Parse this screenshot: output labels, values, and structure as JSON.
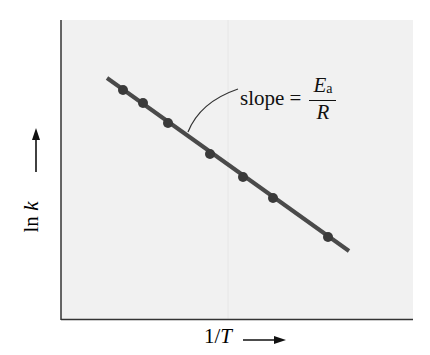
{
  "chart_data": {
    "type": "scatter",
    "title": "",
    "xlabel": "1/T",
    "ylabel": "ln k",
    "x_axis_arrow": "right-arrow",
    "y_axis_arrow": "up-arrow",
    "grid": false,
    "ticks": "none",
    "series": [
      {
        "name": "ln k vs 1/T",
        "points_px": [
          [
            123,
            90
          ],
          [
            143,
            103
          ],
          [
            168,
            123
          ],
          [
            210,
            154
          ],
          [
            243,
            177
          ],
          [
            273,
            198
          ],
          [
            328,
            237
          ]
        ],
        "x": [
          0.18,
          0.23,
          0.3,
          0.42,
          0.52,
          0.6,
          0.76
        ],
        "y": [
          0.77,
          0.72,
          0.66,
          0.55,
          0.48,
          0.41,
          0.28
        ]
      }
    ],
    "fit_line": {
      "from_px": [
        107,
        78
      ],
      "to_px": [
        349,
        251
      ],
      "trend": "decreasing linear"
    },
    "annotation": {
      "text": "slope = ",
      "numerator": "E",
      "numerator_subscript": "a",
      "denominator": "R"
    },
    "colors": {
      "plot_background": "#f1f1f1",
      "line": "#4a4a4a",
      "points": "#3a3a3a",
      "axes": "#333333",
      "text": "#111111"
    }
  }
}
